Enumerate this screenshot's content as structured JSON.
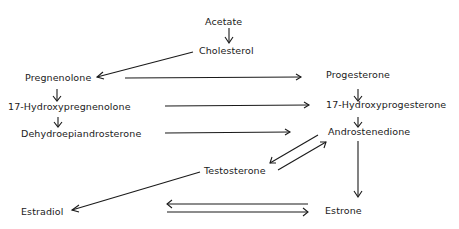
{
  "diagram": {
    "type": "steroid-biosynthesis-pathway",
    "nodes": {
      "acetate": "Acetate",
      "cholesterol": "Cholesterol",
      "pregnenolone": "Pregnenolone",
      "hydroxypregnenolone": "17-Hydroxypregnenolone",
      "dhea": "Dehydroepiandrosterone",
      "progesterone": "Progesterone",
      "hydroxyprogesterone": "17-Hydroxyprogesterone",
      "androstenedione": "Androstenedione",
      "testosterone": "Testosterone",
      "estradiol": "Estradiol",
      "estrone": "Estrone"
    },
    "edges": [
      {
        "from": "Acetate",
        "to": "Cholesterol"
      },
      {
        "from": "Cholesterol",
        "to": "Pregnenolone"
      },
      {
        "from": "Pregnenolone",
        "to": "Progesterone"
      },
      {
        "from": "Pregnenolone",
        "to": "17-Hydroxypregnenolone"
      },
      {
        "from": "17-Hydroxypregnenolone",
        "to": "17-Hydroxyprogesterone"
      },
      {
        "from": "17-Hydroxypregnenolone",
        "to": "Dehydroepiandrosterone"
      },
      {
        "from": "Dehydroepiandrosterone",
        "to": "Androstenedione"
      },
      {
        "from": "Progesterone",
        "to": "17-Hydroxyprogesterone"
      },
      {
        "from": "17-Hydroxyprogesterone",
        "to": "Androstenedione"
      },
      {
        "from": "Androstenedione",
        "to": "Testosterone",
        "bidirectional": true
      },
      {
        "from": "Androstenedione",
        "to": "Estrone"
      },
      {
        "from": "Testosterone",
        "to": "Estradiol"
      },
      {
        "from": "Estrone",
        "to": "Estradiol",
        "bidirectional": true
      }
    ]
  }
}
